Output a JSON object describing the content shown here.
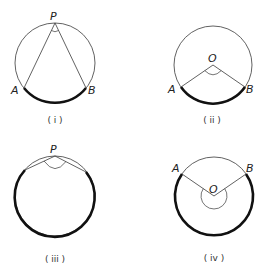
{
  "diagram": {
    "colors": {
      "thin_line": "#3a3a3a",
      "thick_arc": "#111111",
      "text": "#222222",
      "background": "#ffffff"
    },
    "figures": [
      {
        "id": "i",
        "caption": "( i )",
        "circle": {
          "cx": 55,
          "cy": 63,
          "r": 40
        },
        "points": {
          "P": {
            "label": "P",
            "x": 55,
            "y": 23,
            "lx": 50,
            "ly": 20
          },
          "A": {
            "label": "A",
            "x": 24,
            "y": 88,
            "lx": 11,
            "ly": 94
          },
          "B": {
            "label": "B",
            "x": 86,
            "y": 88,
            "lx": 88,
            "ly": 94
          }
        },
        "angle_vertex": "P",
        "highlighted_arc": "minor AB"
      },
      {
        "id": "ii",
        "caption": "( ii )",
        "circle": {
          "cx": 213,
          "cy": 65,
          "r": 39
        },
        "points": {
          "O": {
            "label": "O",
            "x": 213,
            "y": 65,
            "lx": 208,
            "ly": 62
          },
          "A": {
            "label": "A",
            "x": 181,
            "y": 87,
            "lx": 168,
            "ly": 93
          },
          "B": {
            "label": "B",
            "x": 245,
            "y": 87,
            "lx": 246,
            "ly": 93
          }
        },
        "angle_vertex": "O",
        "highlighted_arc": "minor AB"
      },
      {
        "id": "iii",
        "caption": "(iii)",
        "circle": {
          "cx": 55,
          "cy": 196,
          "r": 40
        },
        "points": {
          "P": {
            "label": "P",
            "x": 55,
            "y": 156,
            "lx": 50,
            "ly": 152
          }
        },
        "angle_vertex": "P",
        "highlighted_arc": "major arc"
      },
      {
        "id": "iv",
        "caption": "(iv)",
        "circle": {
          "cx": 214,
          "cy": 196,
          "r": 39
        },
        "points": {
          "O": {
            "label": "O",
            "x": 214,
            "y": 196,
            "lx": 209,
            "ly": 193
          },
          "A": {
            "label": "A",
            "x": 182,
            "y": 174,
            "lx": 172,
            "ly": 172
          },
          "B": {
            "label": "B",
            "x": 246,
            "y": 174,
            "lx": 246,
            "ly": 172
          }
        },
        "angle_vertex": "O",
        "highlighted_arc": "major AB (reflex angle)"
      }
    ],
    "captions": {
      "i": "( i )",
      "ii": "( ii )",
      "iii": "( iii )",
      "iv": "( iv )"
    },
    "labels": {
      "fig1_P": "P",
      "fig1_A": "A",
      "fig1_B": "B",
      "fig2_O": "O",
      "fig2_A": "A",
      "fig2_B": "B",
      "fig3_P": "P",
      "fig4_O": "O",
      "fig4_A": "A",
      "fig4_B": "B"
    }
  }
}
